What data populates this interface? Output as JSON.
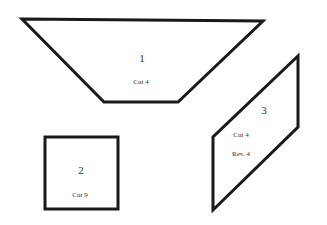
{
  "pieces": [
    {
      "id": "1",
      "number": "1",
      "instructions": [
        "Cut 4"
      ],
      "shape": "trapezoid"
    },
    {
      "id": "2",
      "number": "2",
      "instructions": [
        "Cut 9"
      ],
      "shape": "square"
    },
    {
      "id": "3",
      "number": "3",
      "instructions": [
        "Cut 4",
        "Rev. 4"
      ],
      "shape": "parallelogram"
    }
  ],
  "colors": {
    "stroke": "#1a1a1a",
    "background": "#ffffff"
  }
}
